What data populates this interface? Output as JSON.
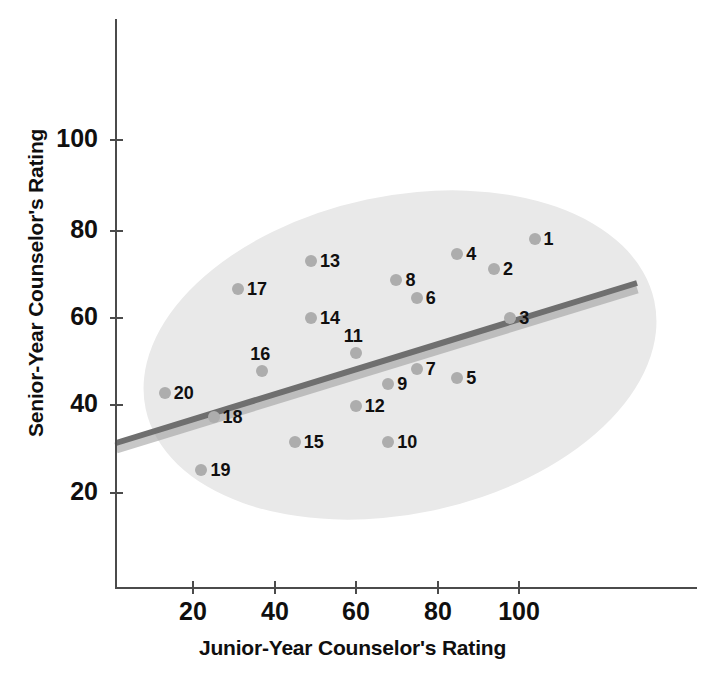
{
  "chart_data": {
    "type": "scatter",
    "title": "",
    "xlabel": "Junior-Year Counselor's Rating",
    "ylabel": "Senior-Year Counselor's Rating",
    "xlim": [
      0,
      120
    ],
    "ylim": [
      0,
      125
    ],
    "xticks": [
      20,
      40,
      60,
      80,
      100
    ],
    "yticks": [
      20,
      40,
      60,
      80,
      100
    ],
    "grid": false,
    "legend": null,
    "annotations": {
      "ellipse": "shaded concentration ellipse enclosing the point cloud",
      "trendline": "straight positive-slope regression line"
    },
    "trendline": {
      "x0": 1,
      "y0": 33,
      "x1": 114,
      "y1": 65
    },
    "point_labels": [
      "1",
      "2",
      "3",
      "4",
      "5",
      "6",
      "7",
      "8",
      "9",
      "10",
      "11",
      "12",
      "13",
      "14",
      "15",
      "16",
      "17",
      "18",
      "19",
      "20"
    ],
    "points": [
      {
        "label": "1",
        "x": 104,
        "y": 77.5
      },
      {
        "label": "2",
        "x": 94,
        "y": 70.5
      },
      {
        "label": "3",
        "x": 98,
        "y": 59.5
      },
      {
        "label": "4",
        "x": 85,
        "y": 74
      },
      {
        "label": "5",
        "x": 85,
        "y": 46
      },
      {
        "label": "6",
        "x": 75,
        "y": 64
      },
      {
        "label": "7",
        "x": 75,
        "y": 48
      },
      {
        "label": "8",
        "x": 70,
        "y": 68
      },
      {
        "label": "9",
        "x": 68,
        "y": 44.5
      },
      {
        "label": "10",
        "x": 68,
        "y": 31.5
      },
      {
        "label": "11",
        "x": 60,
        "y": 51.5
      },
      {
        "label": "12",
        "x": 60,
        "y": 39.5
      },
      {
        "label": "13",
        "x": 49,
        "y": 72.5
      },
      {
        "label": "14",
        "x": 49,
        "y": 59.5
      },
      {
        "label": "15",
        "x": 45,
        "y": 31.5
      },
      {
        "label": "16",
        "x": 37,
        "y": 47.5
      },
      {
        "label": "17",
        "x": 31,
        "y": 66
      },
      {
        "label": "18",
        "x": 25,
        "y": 37
      },
      {
        "label": "19",
        "x": 22,
        "y": 25
      },
      {
        "label": "20",
        "x": 13,
        "y": 42.5
      }
    ]
  },
  "axes": {
    "y_tick_labels": [
      "100",
      "80",
      "60",
      "40",
      "20"
    ],
    "x_tick_labels": [
      "20",
      "40",
      "60",
      "80",
      "100"
    ],
    "y_title": "Senior-Year Counselor's Rating",
    "x_title": "Junior-Year Counselor's Rating"
  },
  "colors": {
    "point": "#adadad",
    "ellipse": "#e9e9e9",
    "trendline": "#7d7d7d",
    "axis": "#4b4b4b",
    "text": "#100f0f"
  }
}
